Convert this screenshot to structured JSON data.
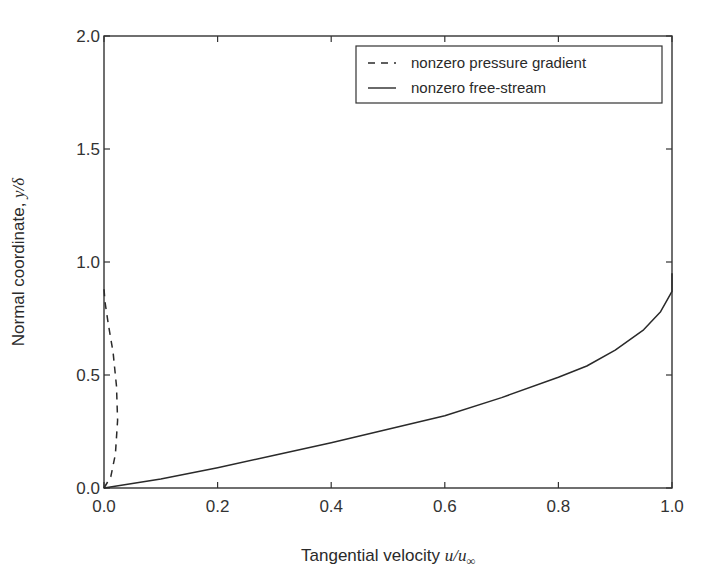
{
  "chart_data": {
    "type": "line",
    "title": "",
    "xlabel": "Tangential velocity u/u∞",
    "xlabel_text": "Tangential velocity ",
    "xlabel_math": "u/u",
    "xlabel_sub": "∞",
    "ylabel": "Normal coordinate, y/δ",
    "ylabel_text": "Normal coordinate, ",
    "ylabel_math": "y/δ",
    "xlim": [
      0.0,
      1.0
    ],
    "ylim": [
      0.0,
      2.0
    ],
    "xticks": [
      "0.0",
      "0.2",
      "0.4",
      "0.6",
      "0.8",
      "1.0"
    ],
    "yticks": [
      "0.0",
      "0.5",
      "1.0",
      "1.5",
      "2.0"
    ],
    "grid": false,
    "legend_position": "upper right",
    "series": [
      {
        "name": "nonzero pressure gradient",
        "style": "dashed",
        "color": "#2a2a2a",
        "x": [
          0.0,
          0.012,
          0.02,
          0.024,
          0.022,
          0.016,
          0.008,
          0.002,
          0.0
        ],
        "y": [
          0.0,
          0.05,
          0.15,
          0.3,
          0.45,
          0.6,
          0.72,
          0.82,
          0.88
        ]
      },
      {
        "name": "nonzero free-stream",
        "style": "solid",
        "color": "#2a2a2a",
        "x": [
          0.0,
          0.1,
          0.2,
          0.3,
          0.4,
          0.5,
          0.6,
          0.7,
          0.8,
          0.85,
          0.9,
          0.95,
          0.98,
          1.0,
          1.0
        ],
        "y": [
          0.0,
          0.04,
          0.09,
          0.145,
          0.2,
          0.26,
          0.32,
          0.4,
          0.49,
          0.54,
          0.61,
          0.7,
          0.78,
          0.87,
          0.95
        ]
      }
    ]
  },
  "legend": {
    "items": [
      {
        "label": "nonzero pressure gradient",
        "style": "dashed"
      },
      {
        "label": "nonzero free-stream",
        "style": "solid"
      }
    ]
  }
}
